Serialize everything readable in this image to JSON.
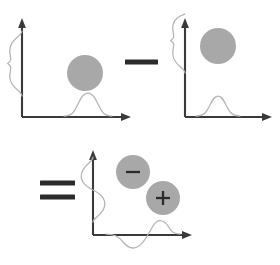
{
  "figure": {
    "background_color": "#ffffff",
    "disk_color": "#a8a8a8",
    "axis_color": "#3a3a3a",
    "curve_color": "#b3b3b3",
    "operator_color": "#2b2b2b",
    "operators": [
      {
        "name": "minus-operator",
        "symbol": "−",
        "x": 141,
        "y": 62
      },
      {
        "name": "equals-operator",
        "symbol": "=",
        "x": 57,
        "y": 190
      }
    ],
    "panels": [
      {
        "id": "panel-minuend",
        "label": "Panel 1",
        "origin": {
          "x": 22,
          "y": 117
        },
        "x_axis_end": {
          "x": 131,
          "y": 117
        },
        "y_axis_end": {
          "x": 22,
          "y": 20
        },
        "disks": [
          {
            "name": "gray-disk",
            "cx": 85,
            "cy": 73,
            "r": 18,
            "sign": ""
          }
        ],
        "y_profile": {
          "type": "gaussian",
          "peak_at": 67,
          "amplitude": 15,
          "sigma": 11,
          "polarity": "positive"
        },
        "x_profile": {
          "type": "gaussian",
          "peak_at": 88,
          "amplitude": 14,
          "sigma": 10,
          "polarity": "positive"
        }
      },
      {
        "id": "panel-subtrahend",
        "label": "Panel 2",
        "origin": {
          "x": 185,
          "y": 117
        },
        "x_axis_end": {
          "x": 272,
          "y": 117
        },
        "y_axis_end": {
          "x": 185,
          "y": 20
        },
        "disks": [
          {
            "name": "gray-disk",
            "cx": 218,
            "cy": 46,
            "r": 18,
            "sign": ""
          }
        ],
        "y_profile": {
          "type": "gaussian",
          "peak_at": 44,
          "amplitude": 15,
          "sigma": 11,
          "polarity": "positive"
        },
        "x_profile": {
          "type": "gaussian",
          "peak_at": 218,
          "amplitude": 13,
          "sigma": 10,
          "polarity": "positive"
        }
      },
      {
        "id": "panel-difference",
        "label": "Panel 3",
        "origin": {
          "x": 93,
          "y": 235
        },
        "x_axis_end": {
          "x": 192,
          "y": 235
        },
        "y_axis_end": {
          "x": 93,
          "y": 150
        },
        "disks": [
          {
            "name": "negative-lobe-disk",
            "cx": 133,
            "cy": 172,
            "r": 17,
            "sign": "−"
          },
          {
            "name": "positive-lobe-disk",
            "cx": 163,
            "cy": 198,
            "r": 17,
            "sign": "+"
          }
        ],
        "y_profile": {
          "type": "derivative",
          "zero_at": 186,
          "amplitude": 14,
          "sigma": 11,
          "polarity": "bipolar"
        },
        "x_profile": {
          "type": "derivative",
          "zero_at": 148,
          "amplitude": 13,
          "sigma": 10,
          "polarity": "bipolar"
        }
      }
    ]
  }
}
